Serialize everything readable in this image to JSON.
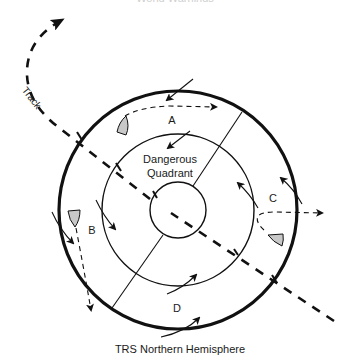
{
  "figure": {
    "top_caption_partial": "World Warnings",
    "caption": "TRS Northern Hemisphere",
    "track_label": "Track",
    "center_label_line1": "Dangerous",
    "center_label_line2": "Quadrant",
    "zones": [
      {
        "id": "A",
        "label": "A"
      },
      {
        "id": "B",
        "label": "B"
      },
      {
        "id": "C",
        "label": "C"
      },
      {
        "id": "D",
        "label": "D"
      }
    ],
    "colors": {
      "stroke": "#111111",
      "sail_fill": "#c8c8c8",
      "background": "#ffffff"
    },
    "geometry": {
      "center": [
        178,
        210
      ],
      "outer_radius": 119,
      "middle_radius": 76,
      "eye_radius": 28
    }
  }
}
